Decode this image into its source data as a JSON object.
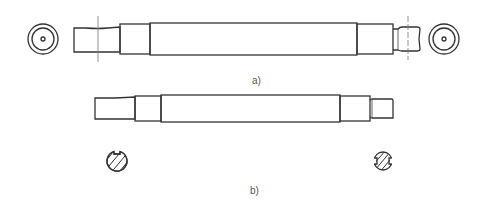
{
  "figure": {
    "background": "#ffffff",
    "line_color": "#333333",
    "label_color": "#555555"
  },
  "views": [
    {
      "id": "a",
      "label": "a)",
      "description": "Stepped shaft with centre holes, side view and end views",
      "parts": [
        "left-end-view",
        "left-journal",
        "left-shoulder",
        "main-body",
        "right-shoulder",
        "right-journal-grooved",
        "right-end-view"
      ]
    },
    {
      "id": "b",
      "label": "b)",
      "description": "Stepped shaft with keyways, side view and cross-sections",
      "parts": [
        "left-journal",
        "left-shoulder",
        "main-body",
        "right-shoulder",
        "right-journal",
        "left-keyway-section",
        "right-double-keyway-section"
      ]
    }
  ]
}
